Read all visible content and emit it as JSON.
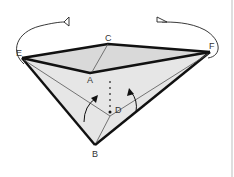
{
  "diagram": {
    "type": "origami-fold-instruction",
    "labels": {
      "E": "E",
      "F": "F",
      "C": "C",
      "A": "A",
      "D": "D",
      "B": "B"
    },
    "colors": {
      "paper_fill": "#e4e4e4",
      "paper_fill_light": "#efefef",
      "outline": "#111111",
      "thin_line": "#555555",
      "label": "#333333",
      "border_line": "#c8c8c8"
    },
    "arrows": [
      {
        "name": "swing-arrow-left",
        "description": "curved arrow from E over top"
      },
      {
        "name": "swing-arrow-right",
        "description": "curved arrow from F over top"
      },
      {
        "name": "fold-up-arrow-left",
        "description": "small curved arrow pointing up-right"
      },
      {
        "name": "fold-up-arrow-right",
        "description": "small curved arrow pointing up-left"
      }
    ]
  }
}
